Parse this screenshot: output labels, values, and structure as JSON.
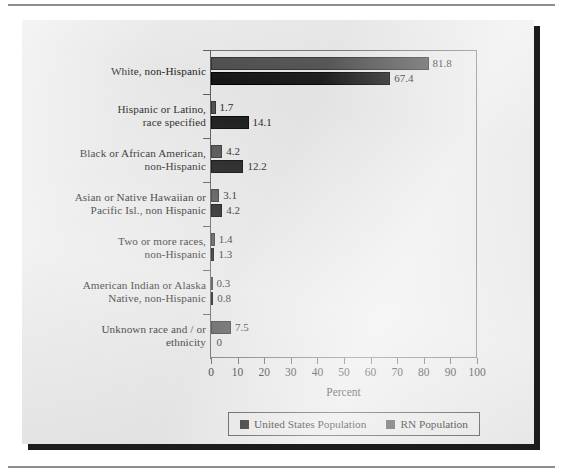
{
  "figure": {
    "background_color": "#e9e9e9",
    "shadow_color": "#1c1c1c"
  },
  "chart_data": {
    "type": "bar",
    "orientation": "horizontal",
    "title": "",
    "xlabel": "Percent",
    "ylabel": "",
    "xlim": [
      0,
      100
    ],
    "xticks": [
      "0",
      "10",
      "20",
      "30",
      "40",
      "50",
      "60",
      "70",
      "80",
      "90",
      "100"
    ],
    "grid": false,
    "legend_position": "bottom",
    "categories": [
      "White, non-Hispanic",
      "Hispanic or Latino, race specified",
      "Black or African American, non-Hispanic",
      "Asian or Native Hawaiian or Pacific Isl., non Hispanic",
      "Two or more races, non-Hispanic",
      "American Indian or Alaska Native, non-Hispanic",
      "Unknown race and/or ethnicity"
    ],
    "category_lines": [
      [
        "White, non-Hispanic"
      ],
      [
        "Hispanic or Latino,",
        "race specified"
      ],
      [
        "Black or African American,",
        "non-Hispanic"
      ],
      [
        "Asian or Native Hawaiian or",
        "Pacific Isl., non Hispanic"
      ],
      [
        "Two or more races,",
        "non-Hispanic"
      ],
      [
        "American Indian or Alaska",
        "Native, non-Hispanic"
      ],
      [
        "Unknown race and / or",
        "ethnicity"
      ]
    ],
    "series": [
      {
        "name": "RN Population",
        "color": "#4d4d4d",
        "values": [
          81.8,
          1.7,
          4.2,
          3.1,
          1.4,
          0.3,
          7.5
        ],
        "labels": [
          "81.8",
          "1.7",
          "4.2",
          "3.1",
          "1.4",
          "0.3",
          "7.5"
        ]
      },
      {
        "name": "United States Population",
        "color": "#161616",
        "values": [
          67.4,
          14.1,
          12.2,
          4.2,
          1.3,
          0.8,
          0
        ],
        "labels": [
          "67.4",
          "14.1",
          "12.2",
          "4.2",
          "1.3",
          "0.8",
          "0"
        ]
      }
    ]
  },
  "legend": {
    "entries": [
      {
        "label": "United States Population",
        "color": "#141414"
      },
      {
        "label": "RN Population",
        "color": "#4d4d4d"
      }
    ]
  }
}
